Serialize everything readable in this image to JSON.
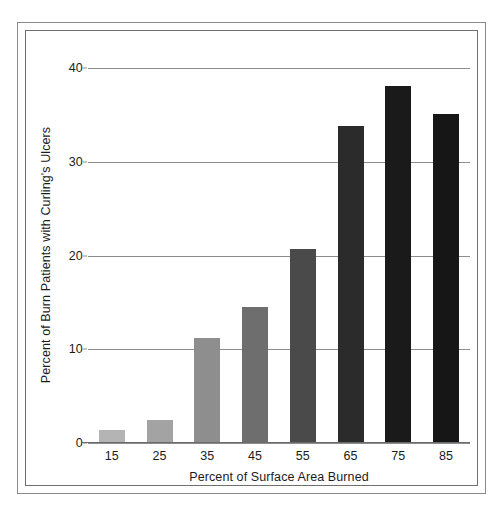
{
  "figure": {
    "background_color": "#ffffff",
    "frame_color": "#8a8a8a",
    "text_color": "#1c1c1c"
  },
  "chart_data": {
    "type": "bar",
    "title": "",
    "xlabel": "Percent of Surface Area Burned",
    "ylabel": "Percent of Burn Patients with Curling's Ulcers",
    "categories": [
      "15",
      "25",
      "35",
      "45",
      "55",
      "65",
      "75",
      "85"
    ],
    "values": [
      1.3,
      2.4,
      11.1,
      14.4,
      20.6,
      33.7,
      38.0,
      35.0
    ],
    "bar_colors": [
      "#b4b4b4",
      "#a3a3a3",
      "#8e8e8e",
      "#6e6e6e",
      "#4a4a4a",
      "#2b2b2b",
      "#1a1a1a",
      "#161616"
    ],
    "ylim": [
      0,
      40
    ],
    "yticks": [
      0,
      10,
      20,
      30,
      40
    ],
    "ytick_labels": [
      "0",
      "10",
      "20",
      "30",
      "40"
    ],
    "xlim_categories": 8,
    "grid": true,
    "grid_axis": "y",
    "grid_color": "#8c8c8c",
    "legend": false,
    "legend_position": "none",
    "annotations": []
  }
}
